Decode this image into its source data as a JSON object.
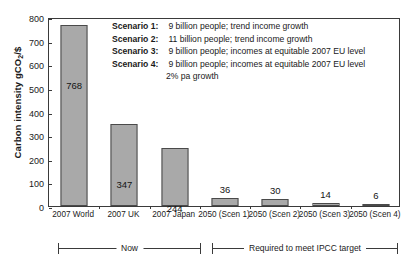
{
  "chart_data": {
    "type": "bar",
    "title": "",
    "xlabel": "",
    "ylabel": "Carbon intensity gCO2/$",
    "ylabel_prefix": "Carbon intensity gCO",
    "ylabel_sub": "2",
    "ylabel_suffix": "/$",
    "ylim": [
      0,
      800
    ],
    "ytick_step": 100,
    "yticks": [
      "800",
      "700",
      "600",
      "500",
      "400",
      "300",
      "200",
      "100",
      "0"
    ],
    "grid": false,
    "legend_position": "none",
    "bar_color": "#a9a9a9",
    "bar_border_color": "#4a4a4a",
    "categories": [
      "2007 World",
      "2007 UK",
      "2007 Japan",
      "2050 (Scen 1)",
      "2050 (Scen 2)",
      "2050 (Scen 3)",
      "2050 (Scen 4)"
    ],
    "values": [
      768,
      347,
      244,
      36,
      30,
      14,
      6
    ],
    "value_labels": [
      "768",
      "347",
      "244",
      "36",
      "30",
      "14",
      "6"
    ],
    "label_placement": [
      "inside",
      "inside",
      "inside",
      "above",
      "above",
      "above",
      "above"
    ]
  },
  "annotations": {
    "scenarios": [
      {
        "key": "Scenario 1:",
        "text": "9 billion people; trend income growth"
      },
      {
        "key": "Scenario 2:",
        "text": "11 billion people; trend income growth"
      },
      {
        "key": "Scenario 3:",
        "text": "9 billion people; incomes at equitable 2007 EU level"
      },
      {
        "key": "Scenario 4:",
        "text": "9 billion people; incomes at equitable 2007 EU level"
      }
    ],
    "scenario_continuation": "2% pa growth",
    "brackets": [
      {
        "label": "Now"
      },
      {
        "label": "Required to meet IPCC target"
      }
    ]
  }
}
